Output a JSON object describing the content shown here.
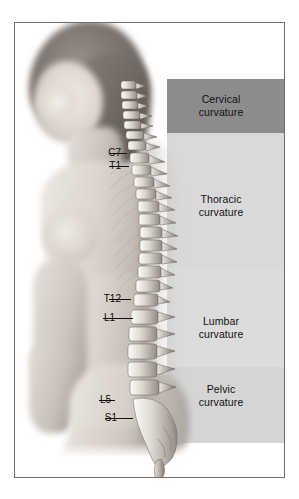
{
  "figure": {
    "background_color": "#ffffff",
    "frame_color": "#6f6f6f"
  },
  "curvature_bands": [
    {
      "id": "cervical",
      "label_line1": "Cervical",
      "label_line2": "curvature",
      "color": "#8c8c8c",
      "top": 56,
      "height": 54
    },
    {
      "id": "thoracic",
      "label_line1": "Thoracic",
      "label_line2": "curvature",
      "color": "#d9d9d9",
      "top": 110,
      "height": 134
    },
    {
      "id": "lumbar",
      "label_line1": "Lumbar",
      "label_line2": "curvature",
      "color": "#dcdcdc",
      "top": 244,
      "height": 100
    },
    {
      "id": "pelvic",
      "label_line1": "Pelvic",
      "label_line2": "curvature",
      "color": "#d5d5d5",
      "top": 344,
      "height": 76
    }
  ],
  "vertebra_labels": [
    {
      "id": "c7",
      "text": "C7",
      "label_right": 108,
      "y": 130,
      "leader_x": 110,
      "leader_w": 18
    },
    {
      "id": "t1",
      "text": "T1",
      "label_right": 108,
      "y": 143,
      "leader_x": 110,
      "leader_w": 18
    },
    {
      "id": "t12",
      "text": "T12",
      "label_right": 124,
      "y": 276,
      "leader_x": 126,
      "leader_w": 18
    },
    {
      "id": "l1",
      "text": "L1",
      "label_right": 118,
      "y": 295,
      "leader_x": 120,
      "leader_w": 28
    },
    {
      "id": "l5",
      "text": "L5",
      "label_right": 112,
      "y": 377,
      "leader_x": 114,
      "leader_w": 14
    },
    {
      "id": "s1",
      "text": "S1",
      "label_right": 114,
      "y": 395,
      "leader_x": 116,
      "leader_w": 26
    }
  ],
  "palette": {
    "skin_light": "#e8e4e0",
    "skin_mid": "#cfc8c2",
    "skin_shadow": "#a9a29c",
    "hair_dark": "#6a635e",
    "hair_mid": "#8a827c",
    "bone_light": "#f2f0ec",
    "bone_mid": "#c9c4bc",
    "bone_dark": "#8d877f",
    "label_text": "#0a0a0a"
  }
}
